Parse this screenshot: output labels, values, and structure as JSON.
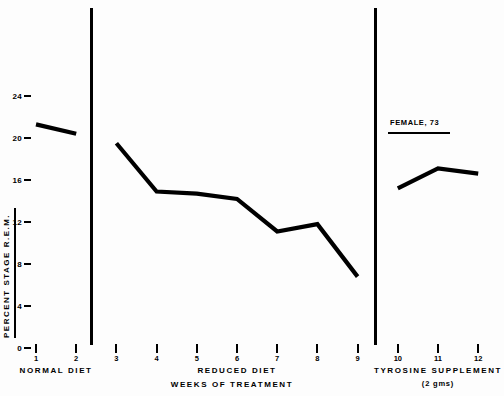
{
  "chart_data": {
    "type": "line",
    "title": "",
    "xlabel": "WEEKS OF TREATMENT",
    "ylabel": "PERCENT STAGE R.E.M.",
    "annotation": "FEMALE, 73",
    "ylim": [
      0,
      26
    ],
    "yticks": [
      0,
      4,
      8,
      12,
      16,
      20,
      24
    ],
    "ytick_labels": [
      "0",
      "4",
      "8",
      "12",
      "16",
      "20",
      "24"
    ],
    "x": [
      1,
      2,
      3,
      4,
      5,
      6,
      7,
      8,
      9,
      10,
      11,
      12
    ],
    "xtick_labels": [
      "1",
      "2",
      "3",
      "4",
      "5",
      "6",
      "7",
      "8",
      "9",
      "10",
      "11",
      "12"
    ],
    "grid": false,
    "legend": "none",
    "series": [
      {
        "name": "NORMAL DIET",
        "x": [
          1,
          2
        ],
        "values": [
          21.3,
          20.4
        ]
      },
      {
        "name": "REDUCED DIET",
        "x": [
          3,
          4,
          5,
          6,
          7,
          8,
          9
        ],
        "values": [
          19.5,
          14.9,
          14.7,
          14.2,
          11.1,
          11.8,
          6.8
        ]
      },
      {
        "name": "TYROSINE SUPPLEMENT",
        "x": [
          10,
          11,
          12
        ],
        "values": [
          15.2,
          17.1,
          16.6
        ]
      }
    ],
    "phases": [
      {
        "label": "NORMAL DIET",
        "sublabel": "",
        "weeks": [
          1,
          2
        ]
      },
      {
        "label": "REDUCED   DIET",
        "sublabel": "",
        "weeks": [
          3,
          4,
          5,
          6,
          7,
          8,
          9
        ]
      },
      {
        "label": "TYROSINE  SUPPLEMENT",
        "sublabel": "(2 gms)",
        "weeks": [
          10,
          11,
          12
        ]
      }
    ]
  },
  "colors": {
    "ink": "#000000",
    "paper": "#fdfdfd"
  }
}
